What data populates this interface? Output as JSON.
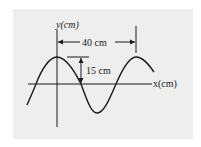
{
  "diagram": {
    "type": "transverse-wave",
    "background_color": "#eeeeee",
    "line_color": "#1a1a1a",
    "y_axis_label": "y(cm)",
    "x_axis_label": "x(cm)",
    "wavelength_label": "40 cm",
    "amplitude_label": "15 cm"
  }
}
